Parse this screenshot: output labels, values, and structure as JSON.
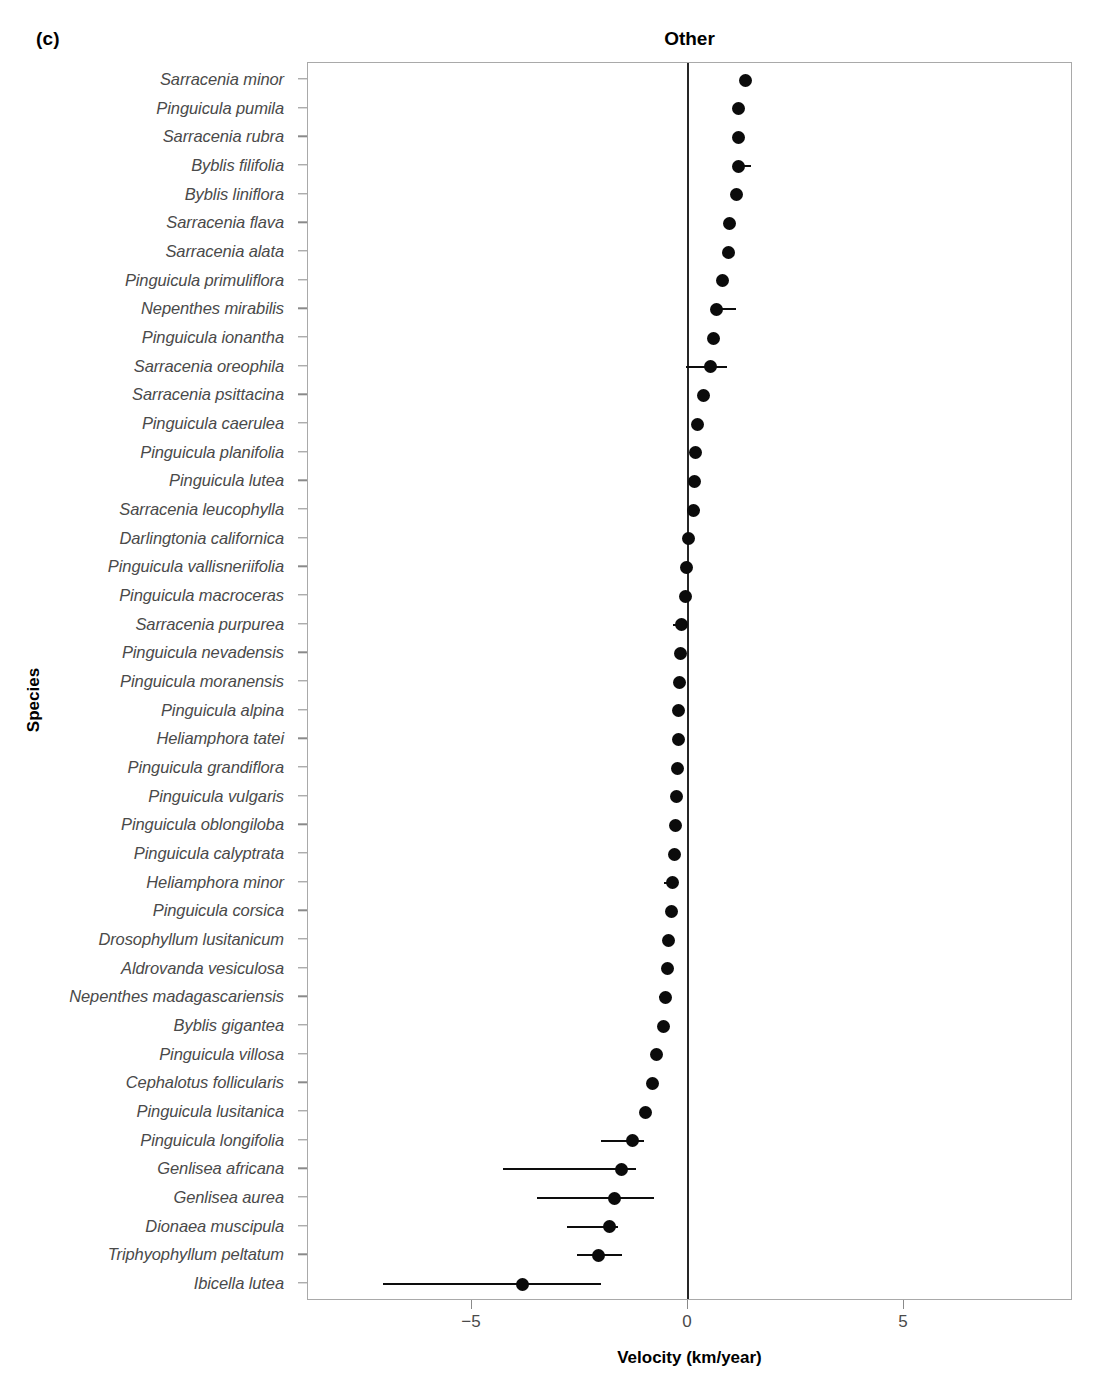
{
  "panel": {
    "tag": "(c)"
  },
  "chart_data": {
    "type": "scatter",
    "title": "Other",
    "xlabel": "Velocity (km/year)",
    "ylabel": "Species",
    "xlim": [
      -8.8,
      8.8
    ],
    "xticks": [
      -5,
      0,
      5
    ],
    "xticklabels": [
      "−5",
      "0",
      "5"
    ],
    "grid": false,
    "legend": null,
    "reference_line_x": 0,
    "categories": [
      "Sarracenia minor",
      "Pinguicula pumila",
      "Sarracenia rubra",
      "Byblis filifolia",
      "Byblis liniflora",
      "Sarracenia flava",
      "Sarracenia alata",
      "Pinguicula primuliflora",
      "Nepenthes mirabilis",
      "Pinguicula ionantha",
      "Sarracenia oreophila",
      "Sarracenia psittacina",
      "Pinguicula caerulea",
      "Pinguicula planifolia",
      "Pinguicula lutea",
      "Sarracenia leucophylla",
      "Darlingtonia californica",
      "Pinguicula vallisneriifolia",
      "Pinguicula macroceras",
      "Sarracenia purpurea",
      "Pinguicula nevadensis",
      "Pinguicula moranensis",
      "Pinguicula alpina",
      "Heliamphora tatei",
      "Pinguicula grandiflora",
      "Pinguicula vulgaris",
      "Pinguicula oblongiloba",
      "Pinguicula calyptrata",
      "Heliamphora minor",
      "Pinguicula corsica",
      "Drosophyllum lusitanicum",
      "Aldrovanda vesiculosa",
      "Nepenthes madagascariensis",
      "Byblis gigantea",
      "Pinguicula villosa",
      "Cephalotus follicularis",
      "Pinguicula lusitanica",
      "Pinguicula longifolia",
      "Genlisea africana",
      "Genlisea aurea",
      "Dionaea muscipula",
      "Triphyophyllum peltatum",
      "Ibicella lutea"
    ],
    "values": [
      1.32,
      1.18,
      1.16,
      1.16,
      1.13,
      0.97,
      0.93,
      0.81,
      0.65,
      0.6,
      0.53,
      0.37,
      0.22,
      0.17,
      0.15,
      0.13,
      0.0,
      -0.03,
      -0.05,
      -0.14,
      -0.18,
      -0.19,
      -0.21,
      -0.22,
      -0.24,
      -0.26,
      -0.29,
      -0.31,
      -0.36,
      -0.38,
      -0.44,
      -0.48,
      -0.52,
      -0.56,
      -0.72,
      -0.82,
      -0.98,
      -1.28,
      -1.55,
      -1.71,
      -1.81,
      -2.08,
      -3.84
    ],
    "ci_low": [
      1.32,
      1.1,
      1.1,
      1.1,
      1.13,
      0.97,
      0.86,
      0.81,
      0.6,
      0.53,
      -0.05,
      0.33,
      0.22,
      0.17,
      0.15,
      0.13,
      0.0,
      -0.03,
      -0.12,
      -0.34,
      -0.18,
      -0.19,
      -0.21,
      -0.22,
      -0.24,
      -0.26,
      -0.29,
      -0.31,
      -0.56,
      -0.38,
      -0.44,
      -0.48,
      -0.66,
      -0.56,
      -0.72,
      -0.9,
      -0.98,
      -2.02,
      -4.28,
      -3.5,
      -2.8,
      -2.56,
      -7.06
    ],
    "ci_high": [
      1.32,
      1.24,
      1.22,
      1.45,
      1.13,
      0.97,
      1.0,
      0.81,
      1.1,
      0.6,
      0.9,
      0.37,
      0.28,
      0.17,
      0.15,
      0.13,
      0.0,
      -0.03,
      -0.05,
      -0.14,
      -0.18,
      -0.19,
      -0.21,
      -0.22,
      -0.24,
      -0.26,
      -0.29,
      -0.22,
      -0.3,
      -0.38,
      -0.44,
      -0.42,
      -0.52,
      -0.56,
      -0.72,
      -0.82,
      -0.98,
      -1.02,
      -1.2,
      -0.79,
      -1.62,
      -1.52,
      -2.01
    ]
  }
}
